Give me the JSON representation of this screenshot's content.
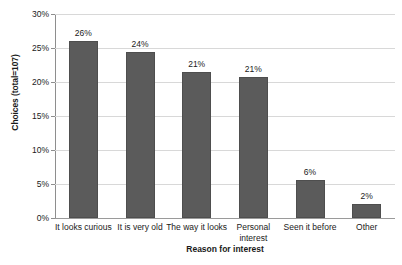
{
  "chart_data": {
    "type": "bar",
    "title": "",
    "xlabel": "Reason for interest",
    "ylabel": "Choices (total=107)",
    "categories": [
      "It looks curious",
      "It is very old",
      "The way it looks",
      "Personal interest",
      "Seen it before",
      "Other"
    ],
    "values": [
      26.1,
      24.4,
      21.5,
      20.7,
      5.6,
      2.0
    ],
    "data_labels": [
      "26%",
      "24%",
      "21%",
      "21%",
      "6%",
      "2%"
    ],
    "ylim": [
      0,
      30
    ],
    "ytick_values": [
      0,
      5,
      10,
      15,
      20,
      25,
      30
    ],
    "ytick_labels": [
      "0%",
      "5%",
      "10%",
      "15%",
      "20%",
      "25%",
      "30%"
    ],
    "grid": true,
    "legend": false,
    "bar_color": "#5b5b5b",
    "gridline_color": "#d8d8d8",
    "axis_color": "#8e8e8e",
    "background_color": "#ffffff"
  }
}
